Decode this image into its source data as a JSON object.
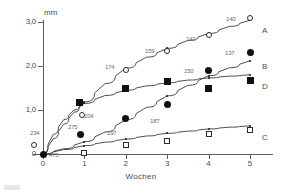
{
  "chart_data": {
    "type": "line",
    "title": "",
    "xlabel": "Wochen",
    "ylabel": "mm",
    "xlim": [
      -0.35,
      5.6
    ],
    "ylim": [
      -0.12,
      3.25
    ],
    "xticks": [
      "0",
      "1",
      "2",
      "3",
      "4",
      "5"
    ],
    "yticks": [
      "0",
      "1,0",
      "2,0",
      "3,0"
    ],
    "ytick_values": [
      0,
      1.0,
      2.0,
      3.0
    ],
    "grid": false,
    "legend_position": "right-inline",
    "series": [
      {
        "name": "A",
        "marker": "open-circle",
        "x": [
          0,
          1,
          2,
          3,
          4,
          5
        ],
        "values": [
          0.2,
          0.88,
          1.9,
          2.35,
          2.7,
          3.1
        ],
        "point_labels": [
          "234",
          "204",
          "174",
          "159",
          "142",
          "140"
        ]
      },
      {
        "name": "B",
        "marker": "filled-circle",
        "x": [
          0,
          1,
          2,
          3,
          4,
          5
        ],
        "values": [
          0.0,
          0.45,
          0.8,
          1.13,
          1.9,
          2.3
        ],
        "point_labels": [
          "475",
          "275",
          "197",
          "187",
          "150",
          "137"
        ]
      },
      {
        "name": "D",
        "marker": "filled-square",
        "x": [
          1,
          2,
          3,
          4,
          5
        ],
        "values": [
          1.17,
          1.48,
          1.65,
          1.5,
          1.67
        ],
        "point_labels": [
          "",
          "",
          "",
          "",
          ""
        ]
      },
      {
        "name": "C",
        "marker": "open-square",
        "x": [
          1,
          2,
          3,
          4,
          5
        ],
        "values": [
          0.02,
          0.2,
          0.3,
          0.45,
          0.55
        ],
        "point_labels": [
          "",
          "",
          "",
          "",
          ""
        ]
      }
    ],
    "fit_curves": [
      {
        "name": "A",
        "points": [
          [
            0,
            0.0
          ],
          [
            0.25,
            0.35
          ],
          [
            0.5,
            0.68
          ],
          [
            0.75,
            0.95
          ],
          [
            1.0,
            1.18
          ],
          [
            1.5,
            1.6
          ],
          [
            2.0,
            1.95
          ],
          [
            2.5,
            2.2
          ],
          [
            3.0,
            2.4
          ],
          [
            3.5,
            2.58
          ],
          [
            4.0,
            2.74
          ],
          [
            4.5,
            2.9
          ],
          [
            5.0,
            3.04
          ]
        ]
      },
      {
        "name": "B",
        "points": [
          [
            0,
            0.0
          ],
          [
            0.5,
            0.12
          ],
          [
            1.0,
            0.28
          ],
          [
            1.5,
            0.5
          ],
          [
            2.0,
            0.78
          ],
          [
            2.5,
            1.06
          ],
          [
            3.0,
            1.32
          ],
          [
            3.5,
            1.56
          ],
          [
            4.0,
            1.78
          ],
          [
            4.5,
            1.96
          ],
          [
            5.0,
            2.12
          ]
        ]
      },
      {
        "name": "D",
        "points": [
          [
            0,
            0.0
          ],
          [
            0.25,
            0.45
          ],
          [
            0.5,
            0.78
          ],
          [
            0.75,
            1.0
          ],
          [
            1.0,
            1.15
          ],
          [
            1.5,
            1.33
          ],
          [
            2.0,
            1.45
          ],
          [
            2.5,
            1.55
          ],
          [
            3.0,
            1.62
          ],
          [
            3.5,
            1.68
          ],
          [
            4.0,
            1.73
          ],
          [
            4.5,
            1.77
          ],
          [
            5.0,
            1.8
          ]
        ]
      },
      {
        "name": "C",
        "points": [
          [
            0,
            0.0
          ],
          [
            0.5,
            0.1
          ],
          [
            1.0,
            0.19
          ],
          [
            1.5,
            0.27
          ],
          [
            2.0,
            0.34
          ],
          [
            2.5,
            0.41
          ],
          [
            3.0,
            0.47
          ],
          [
            3.5,
            0.52
          ],
          [
            4.0,
            0.57
          ],
          [
            4.5,
            0.61
          ],
          [
            5.0,
            0.64
          ]
        ]
      }
    ],
    "fit_dots": [
      {
        "name": "A",
        "points": [
          [
            1.0,
            1.18
          ],
          [
            2.0,
            1.95
          ],
          [
            3.0,
            2.4
          ],
          [
            4.0,
            2.74
          ],
          [
            5.0,
            3.04
          ]
        ]
      },
      {
        "name": "B",
        "points": [
          [
            1.0,
            0.28
          ],
          [
            2.0,
            0.78
          ],
          [
            3.0,
            1.32
          ],
          [
            4.0,
            1.78
          ],
          [
            5.0,
            2.12
          ]
        ]
      },
      {
        "name": "D",
        "points": [
          [
            1.0,
            1.15
          ],
          [
            2.0,
            1.45
          ],
          [
            3.0,
            1.62
          ],
          [
            4.0,
            1.73
          ],
          [
            5.0,
            1.8
          ]
        ]
      },
      {
        "name": "C",
        "points": [
          [
            1.0,
            0.19
          ],
          [
            2.0,
            0.34
          ],
          [
            3.0,
            0.47
          ],
          [
            4.0,
            0.57
          ],
          [
            5.0,
            0.64
          ]
        ]
      }
    ]
  },
  "axis": {
    "y_title": "mm",
    "x_title": "Wochen"
  },
  "series_letters": [
    {
      "label": "A",
      "x": 262,
      "y": 27
    },
    {
      "label": "B",
      "x": 262,
      "y": 63
    },
    {
      "label": "D",
      "x": 262,
      "y": 83
    },
    {
      "label": "C",
      "x": 262,
      "y": 134
    }
  ],
  "annotations": [
    {
      "text": "234",
      "x": 30,
      "y": 130
    },
    {
      "text": "475",
      "x": 49,
      "y": 152
    },
    {
      "text": "275",
      "x": 68,
      "y": 124
    },
    {
      "text": "204",
      "x": 84,
      "y": 113
    },
    {
      "text": "174",
      "x": 105,
      "y": 64
    },
    {
      "text": "197",
      "x": 107,
      "y": 130
    },
    {
      "text": "159",
      "x": 145,
      "y": 48
    },
    {
      "text": "187",
      "x": 150,
      "y": 118
    },
    {
      "text": "142",
      "x": 186,
      "y": 36
    },
    {
      "text": "150",
      "x": 184,
      "y": 68
    },
    {
      "text": "140",
      "x": 226,
      "y": 16
    },
    {
      "text": "137",
      "x": 225,
      "y": 50
    }
  ],
  "colors": {
    "axis": "#5d5d5d",
    "curve": "#3c3c3c",
    "marker_fill": "#111111",
    "marker_outline": "#2b2b2b",
    "label_text": "#6a6a6a",
    "background": "#ffffff"
  }
}
